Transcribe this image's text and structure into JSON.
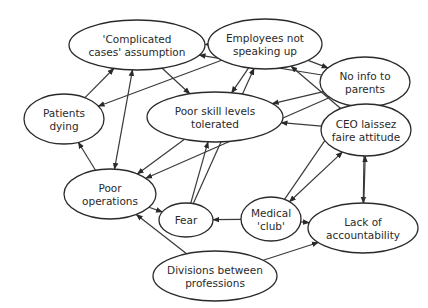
{
  "diagram": {
    "type": "causal-loop",
    "colors": {
      "background": "#ffffff",
      "stroke": "#2a2a2a",
      "text": "#2a2a2a"
    },
    "nodes": [
      {
        "id": "complicated",
        "lines": [
          "'Complicated",
          "cases' assumption"
        ],
        "cx": 137,
        "cy": 45,
        "rx": 68,
        "ry": 25
      },
      {
        "id": "employees",
        "lines": [
          "Employees not",
          "speaking up"
        ],
        "cx": 265,
        "cy": 44,
        "rx": 57,
        "ry": 25
      },
      {
        "id": "noinfo",
        "lines": [
          "No info to",
          "parents"
        ],
        "cx": 365,
        "cy": 82,
        "rx": 45,
        "ry": 25
      },
      {
        "id": "patients",
        "lines": [
          "Patients",
          "dying"
        ],
        "cx": 64,
        "cy": 119,
        "rx": 40,
        "ry": 25
      },
      {
        "id": "poorskill",
        "lines": [
          "Poor skill levels",
          "tolerated"
        ],
        "cx": 215,
        "cy": 117,
        "rx": 68,
        "ry": 25
      },
      {
        "id": "ceo",
        "lines": [
          "CEO laissez",
          "faire attitude"
        ],
        "cx": 366,
        "cy": 130,
        "rx": 45,
        "ry": 26
      },
      {
        "id": "poorops",
        "lines": [
          "Poor",
          "operations"
        ],
        "cx": 110,
        "cy": 194,
        "rx": 46,
        "ry": 25
      },
      {
        "id": "fear",
        "lines": [
          "Fear"
        ],
        "cx": 186,
        "cy": 220,
        "rx": 27,
        "ry": 17
      },
      {
        "id": "medical",
        "lines": [
          "Medical",
          "'club'"
        ],
        "cx": 271,
        "cy": 219,
        "rx": 30,
        "ry": 22
      },
      {
        "id": "lack",
        "lines": [
          "Lack of",
          "accountability"
        ],
        "cx": 363,
        "cy": 228,
        "rx": 55,
        "ry": 25
      },
      {
        "id": "divisions",
        "lines": [
          "Divisions between",
          "professions"
        ],
        "cx": 215,
        "cy": 276,
        "rx": 62,
        "ry": 25
      }
    ],
    "edges": [
      {
        "from": "employees",
        "to": "complicated",
        "double": false
      },
      {
        "from": "noinfo",
        "to": "complicated",
        "double": false
      },
      {
        "from": "employees",
        "to": "noinfo",
        "double": false
      },
      {
        "from": "complicated",
        "to": "poorskill",
        "double": false
      },
      {
        "from": "employees",
        "to": "patients",
        "double": false
      },
      {
        "from": "patients",
        "to": "complicated",
        "double": false
      },
      {
        "from": "complicated",
        "to": "poorops",
        "double": true
      },
      {
        "from": "employees",
        "to": "poorskill",
        "double": false
      },
      {
        "from": "noinfo",
        "to": "poorskill",
        "double": false
      },
      {
        "from": "poorskill",
        "to": "poorops",
        "double": false
      },
      {
        "from": "poorops",
        "to": "patients",
        "double": false
      },
      {
        "from": "noinfo",
        "to": "poorops",
        "double": false
      },
      {
        "from": "ceo",
        "to": "poorskill",
        "double": false
      },
      {
        "from": "fear",
        "to": "poorskill",
        "double": false
      },
      {
        "from": "fear",
        "to": "employees",
        "double": false
      },
      {
        "from": "poorops",
        "to": "fear",
        "double": false
      },
      {
        "from": "medical",
        "to": "fear",
        "double": false
      },
      {
        "from": "medical",
        "to": "noinfo",
        "double": false
      },
      {
        "from": "medical",
        "to": "ceo",
        "double": true
      },
      {
        "from": "medical",
        "to": "lack",
        "double": false
      },
      {
        "from": "ceo",
        "to": "employees",
        "double": false
      },
      {
        "from": "noinfo",
        "to": "ceo",
        "double": false
      },
      {
        "from": "noinfo",
        "to": "lack",
        "double": false
      },
      {
        "from": "lack",
        "to": "ceo",
        "double": false
      },
      {
        "from": "divisions",
        "to": "poorops",
        "double": false
      },
      {
        "from": "divisions",
        "to": "lack",
        "double": false
      }
    ]
  }
}
